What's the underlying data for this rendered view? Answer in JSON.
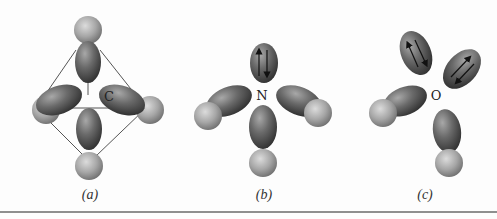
{
  "figure": {
    "panels": [
      {
        "id": "a",
        "label": "(a)",
        "central_atom": "C",
        "description": "Tetrahedral arrangement: four bonding hybrid orbitals each overlapping a substituent sphere, enclosed by a tetrahedron outline",
        "bonding_lobes": 4,
        "lone_pair_lobes": 0
      },
      {
        "id": "b",
        "label": "(b)",
        "central_atom": "N",
        "description": "Three bonding hybrid orbitals with substituent spheres and one lone-pair lobe containing paired spin arrows",
        "bonding_lobes": 3,
        "lone_pair_lobes": 1
      },
      {
        "id": "c",
        "label": "(c)",
        "central_atom": "O",
        "description": "Two bonding hybrid orbitals with substituent spheres and two lone-pair lobes each containing paired spin arrows",
        "bonding_lobes": 2,
        "lone_pair_lobes": 2
      }
    ],
    "colors": {
      "lobe_dark": "#3a3a3a",
      "lobe_light": "#9a9a9a",
      "sphere_dark": "#6e6e6e",
      "sphere_light": "#d4d4d4",
      "outline": "#555555",
      "rule": "#6a6a6a"
    }
  }
}
